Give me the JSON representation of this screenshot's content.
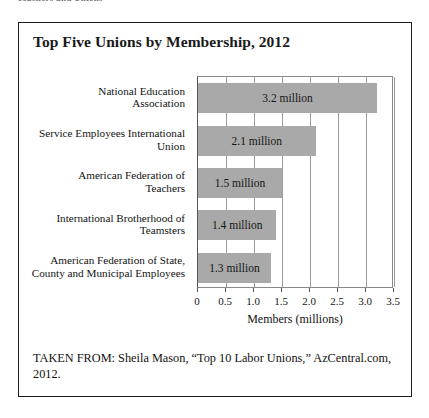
{
  "page_header_partial": "Teachers and Unions",
  "figure": {
    "title": "Top Five Unions by Membership, 2012",
    "source_note": "TAKEN FROM: Sheila Mason, “Top 10 Labor Unions,” AzCentral.com, 2012."
  },
  "chart_data": {
    "type": "bar",
    "orientation": "horizontal",
    "title": "Top Five Unions by Membership, 2012",
    "xlabel": "Members (millions)",
    "ylabel": "",
    "xlim": [
      0,
      3.5
    ],
    "xticks": [
      "0",
      "0.5",
      "1.0",
      "1.5",
      "2.0",
      "2.5",
      "3.0",
      "3.5"
    ],
    "xtick_values": [
      0,
      0.5,
      1.0,
      1.5,
      2.0,
      2.5,
      3.0,
      3.5
    ],
    "grid": "vertical",
    "legend": "none",
    "bar_color": "#a9a9a9",
    "categories": [
      "National Education Association",
      "Service Employees International Union",
      "American Federation of Teachers",
      "International Brotherhood of Teamsters",
      "American Federation of State, County and Municipal Employees"
    ],
    "category_lines": [
      [
        "National Education",
        "Association"
      ],
      [
        "Service Employees International",
        "Union"
      ],
      [
        "American Federation of",
        "Teachers"
      ],
      [
        "International Brotherhood of",
        "Teamsters"
      ],
      [
        "American Federation of State,",
        "County and Municipal Employees"
      ]
    ],
    "values": [
      3.2,
      2.1,
      1.5,
      1.4,
      1.3
    ],
    "data_labels": [
      "3.2 million",
      "2.1 million",
      "1.5 million",
      "1.4 million",
      "1.3 million"
    ]
  }
}
